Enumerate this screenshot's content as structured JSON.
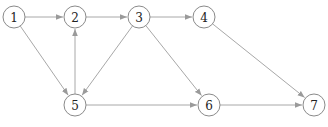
{
  "diagram": {
    "type": "directed-graph",
    "colors": {
      "node_stroke": "#8a8a8a",
      "edge": "#a8a8a8",
      "label": "#222222",
      "background": "#ffffff"
    },
    "node_radius": 11,
    "nodes": [
      {
        "id": "1",
        "label": "1",
        "x": 14,
        "y": 17
      },
      {
        "id": "2",
        "label": "2",
        "x": 75,
        "y": 17
      },
      {
        "id": "3",
        "label": "3",
        "x": 139,
        "y": 17
      },
      {
        "id": "4",
        "label": "4",
        "x": 204,
        "y": 17
      },
      {
        "id": "5",
        "label": "5",
        "x": 75,
        "y": 105
      },
      {
        "id": "6",
        "label": "6",
        "x": 209,
        "y": 105
      },
      {
        "id": "7",
        "label": "7",
        "x": 314,
        "y": 105
      }
    ],
    "edges": [
      {
        "from": "1",
        "to": "2"
      },
      {
        "from": "2",
        "to": "3"
      },
      {
        "from": "3",
        "to": "4"
      },
      {
        "from": "1",
        "to": "5"
      },
      {
        "from": "5",
        "to": "2"
      },
      {
        "from": "3",
        "to": "5"
      },
      {
        "from": "3",
        "to": "6"
      },
      {
        "from": "5",
        "to": "6"
      },
      {
        "from": "4",
        "to": "7"
      },
      {
        "from": "6",
        "to": "7"
      }
    ]
  }
}
